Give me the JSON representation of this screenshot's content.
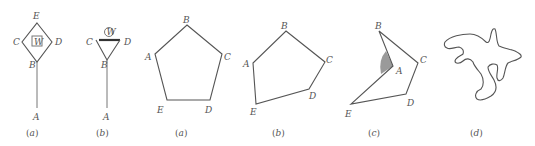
{
  "figures": [
    {
      "id": "fig-a-left",
      "caption": "(a)",
      "caption_letter": "a",
      "labels": {
        "E": "E",
        "C": "C",
        "D": "D",
        "B": "B",
        "A": "A",
        "W": "W"
      }
    },
    {
      "id": "fig-b-left",
      "caption": "(b)",
      "caption_letter": "b",
      "labels": {
        "C": "C",
        "D": "D",
        "B": "B",
        "A": "A",
        "W": "W"
      }
    },
    {
      "id": "fig-a-pentagon",
      "caption": "(a)",
      "caption_letter": "a",
      "labels": {
        "A": "A",
        "B": "B",
        "C": "C",
        "D": "D",
        "E": "E"
      }
    },
    {
      "id": "fig-b-pentagon",
      "caption": "(b)",
      "caption_letter": "b",
      "labels": {
        "A": "A",
        "B": "B",
        "C": "C",
        "D": "D",
        "E": "E"
      }
    },
    {
      "id": "fig-c-concave",
      "caption": "(c)",
      "caption_letter": "c",
      "labels": {
        "A": "A",
        "B": "B",
        "C": "C",
        "D": "D",
        "E": "E"
      }
    },
    {
      "id": "fig-d-curve",
      "caption": "(d)",
      "caption_letter": "d"
    }
  ],
  "colors": {
    "stroke": "#555555",
    "shade": "#9a9a9a",
    "text": "#555555"
  }
}
